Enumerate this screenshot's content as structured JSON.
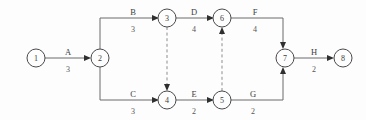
{
  "diagram": {
    "type": "activity-on-arrow-network",
    "title": "",
    "canvas": {
      "width": 366,
      "height": 120,
      "background": "#fdfdfd"
    },
    "colors": {
      "line": "#6b6b6b",
      "dashed_line": "#8d8d8d",
      "node_stroke": "#4a4a4a",
      "text": "#3c3c3c",
      "arrow": "#2f2f2f"
    },
    "nodes": [
      {
        "id": "1",
        "label": "1",
        "cx": 36,
        "cy": 58,
        "r": 9
      },
      {
        "id": "2",
        "label": "2",
        "cx": 100,
        "cy": 58,
        "r": 9
      },
      {
        "id": "3",
        "label": "3",
        "cx": 167,
        "cy": 18,
        "r": 9
      },
      {
        "id": "4",
        "label": "4",
        "cx": 167,
        "cy": 100,
        "r": 9
      },
      {
        "id": "5",
        "label": "5",
        "cx": 222,
        "cy": 100,
        "r": 9
      },
      {
        "id": "6",
        "label": "6",
        "cx": 222,
        "cy": 18,
        "r": 9
      },
      {
        "id": "7",
        "label": "7",
        "cx": 285,
        "cy": 58,
        "r": 9
      },
      {
        "id": "8",
        "label": "8",
        "cx": 343,
        "cy": 58,
        "r": 9
      }
    ],
    "edges": [
      {
        "id": "A",
        "name": "A",
        "duration": "3",
        "from": "1",
        "to": "2",
        "style": "solid",
        "name_x": 68,
        "name_y": 52,
        "dur_x": 68,
        "dur_y": 70
      },
      {
        "id": "B",
        "name": "B",
        "duration": "3",
        "from": "2",
        "to": "3",
        "style": "solid",
        "name_x": 133,
        "name_y": 12,
        "dur_x": 133,
        "dur_y": 29
      },
      {
        "id": "C",
        "name": "C",
        "duration": "3",
        "from": "2",
        "to": "4",
        "style": "solid",
        "name_x": 133,
        "name_y": 94,
        "dur_x": 133,
        "dur_y": 111
      },
      {
        "id": "D",
        "name": "D",
        "duration": "4",
        "from": "3",
        "to": "6",
        "style": "solid",
        "name_x": 194,
        "name_y": 12,
        "dur_x": 194,
        "dur_y": 29
      },
      {
        "id": "E",
        "name": "E",
        "duration": "2",
        "from": "4",
        "to": "5",
        "style": "solid",
        "name_x": 194,
        "name_y": 94,
        "dur_x": 194,
        "dur_y": 111
      },
      {
        "id": "F",
        "name": "F",
        "duration": "4",
        "from": "6",
        "to": "7",
        "style": "solid",
        "name_x": 255,
        "name_y": 12,
        "dur_x": 255,
        "dur_y": 29
      },
      {
        "id": "G",
        "name": "G",
        "duration": "2",
        "from": "5",
        "to": "7",
        "style": "solid",
        "name_x": 253,
        "name_y": 94,
        "dur_x": 253,
        "dur_y": 111
      },
      {
        "id": "H",
        "name": "H",
        "duration": "2",
        "from": "7",
        "to": "8",
        "style": "solid",
        "name_x": 314,
        "name_y": 52,
        "dur_x": 314,
        "dur_y": 70
      },
      {
        "id": "dummy-3-4",
        "name": "",
        "duration": "",
        "from": "3",
        "to": "4",
        "style": "dashed",
        "name_x": 0,
        "name_y": 0,
        "dur_x": 0,
        "dur_y": 0
      },
      {
        "id": "dummy-5-6",
        "name": "",
        "duration": "",
        "from": "5",
        "to": "6",
        "style": "dashed",
        "name_x": 0,
        "name_y": 0,
        "dur_x": 0,
        "dur_y": 0
      }
    ]
  }
}
